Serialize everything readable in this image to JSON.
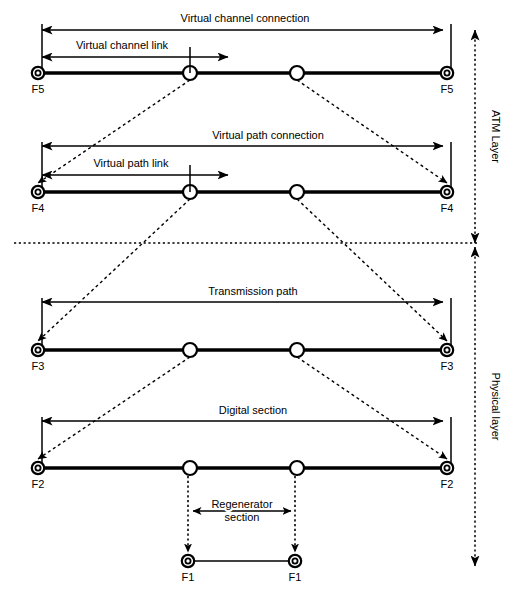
{
  "figure": {
    "background_color": "#ffffff",
    "line_color": "#000000",
    "width": 509,
    "height": 599
  },
  "layers": [
    {
      "id": "atm-layer",
      "label": "ATM Layer",
      "label_x": 492,
      "arrow_x": 475,
      "y_top": 30,
      "y_bottom": 243
    },
    {
      "id": "physical-layer",
      "label": "Physical layer",
      "label_x": 492,
      "arrow_x": 475,
      "y_top": 247,
      "y_bottom": 566
    }
  ],
  "divider": {
    "name": "layer-divider",
    "y": 243,
    "x1": 14,
    "x2": 478
  },
  "rows": [
    {
      "id": "f5",
      "endpoint_label": "F5",
      "baseline_y": 73,
      "x_left": 38,
      "x_right": 447,
      "tick_top": 28,
      "nodes": [
        190,
        297
      ],
      "connection": {
        "label": "Virtual channel connection",
        "y": 30,
        "x1": 42,
        "x2": 443,
        "label_x": 245,
        "label_y": 22
      },
      "link": {
        "label": "Virtual channel link",
        "y": 57,
        "x1": 42,
        "x2": 228,
        "tick_x": 190,
        "label_x": 122,
        "label_y": 49
      }
    },
    {
      "id": "f4",
      "endpoint_label": "F4",
      "baseline_y": 192,
      "x_left": 38,
      "x_right": 447,
      "tick_top": 146,
      "nodes": [
        190,
        297
      ],
      "connection": {
        "label": "Virtual path connection",
        "y": 146,
        "x1": 42,
        "x2": 443,
        "label_x": 268,
        "label_y": 139
      },
      "link": {
        "label": "Virtual path link",
        "y": 175,
        "x1": 42,
        "x2": 228,
        "tick_x": 190,
        "label_x": 131,
        "label_y": 167
      }
    },
    {
      "id": "f3",
      "endpoint_label": "F3",
      "baseline_y": 350,
      "x_left": 38,
      "x_right": 447,
      "tick_top": 302,
      "nodes": [
        190,
        297
      ],
      "connection": {
        "label": "Transmission path",
        "y": 302,
        "x1": 42,
        "x2": 443,
        "label_x": 253,
        "label_y": 295
      },
      "link": null
    },
    {
      "id": "f2",
      "endpoint_label": "F2",
      "baseline_y": 468,
      "x_left": 38,
      "x_right": 447,
      "tick_top": 421,
      "nodes": [
        190,
        297
      ],
      "connection": {
        "label": "Digital section",
        "y": 421,
        "x1": 42,
        "x2": 443,
        "label_x": 253,
        "label_y": 414
      },
      "link": null
    }
  ],
  "regenerator_row": {
    "id": "f1",
    "endpoint_label": "F1",
    "baseline_y": 561,
    "x_left": 188,
    "x_right": 295,
    "drop_from_y": 468,
    "drop_to_y": 552,
    "section": {
      "label_line1": "Regenerator",
      "label_line2": "section",
      "y": 511,
      "x1": 193,
      "x2": 291,
      "label_x": 242,
      "label_y1": 508,
      "label_y2": 521
    }
  },
  "mux_links": [
    {
      "from_row": "f5",
      "from_x": 190,
      "to_row": "f4",
      "to_x": 38
    },
    {
      "from_row": "f5",
      "from_x": 297,
      "to_row": "f4",
      "to_x": 447
    },
    {
      "from_row": "f4",
      "from_x": 190,
      "to_row": "f3",
      "to_x": 38
    },
    {
      "from_row": "f4",
      "from_x": 297,
      "to_row": "f3",
      "to_x": 447
    },
    {
      "from_row": "f3",
      "from_x": 190,
      "to_row": "f2",
      "to_x": 38
    },
    {
      "from_row": "f3",
      "from_x": 297,
      "to_row": "f2",
      "to_x": 447
    }
  ]
}
